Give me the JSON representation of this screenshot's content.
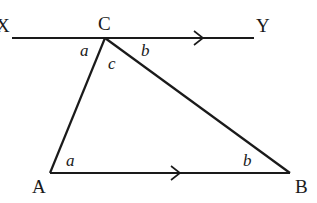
{
  "diagram": {
    "type": "geometry",
    "colors": {
      "stroke": "#1a1a1a",
      "background": "#ffffff"
    },
    "points": {
      "X": {
        "label": "X",
        "x": 12,
        "y": 38
      },
      "Y": {
        "label": "Y",
        "x": 254,
        "y": 38
      },
      "C": {
        "label": "C",
        "x": 105,
        "y": 38
      },
      "A": {
        "label": "A",
        "x": 50,
        "y": 173
      },
      "B": {
        "label": "B",
        "x": 290,
        "y": 173
      }
    },
    "angle_labels": {
      "XCA": "a",
      "ACB": "c",
      "BCY": "b",
      "CAB": "a",
      "CBA": "b"
    },
    "parallel_marks": [
      "XY",
      "AB"
    ]
  }
}
